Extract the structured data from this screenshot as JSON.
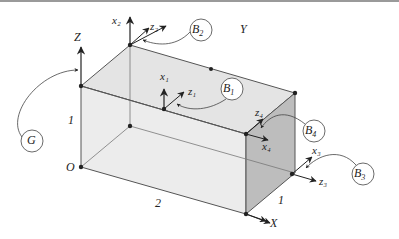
{
  "diagram": {
    "type": "3D box with coordinate frames",
    "global_axes": {
      "x_label": "X",
      "y_label": "Y",
      "z_label": "Z",
      "origin_label": "O"
    },
    "dimensions": {
      "length": "2",
      "width": "1",
      "height": "1"
    },
    "frames": [
      {
        "id": "B1",
        "x_label": "x1",
        "z_label": "z1",
        "body_label": "B1"
      },
      {
        "id": "B2",
        "x_label": "x2",
        "z_label": "z2",
        "body_label": "B2"
      },
      {
        "id": "B3",
        "x_label": "x3",
        "z_label": "z3",
        "body_label": "B3"
      },
      {
        "id": "B4",
        "x_label": "x4",
        "z_label": "z4",
        "body_label": "B4"
      }
    ],
    "ground_label": "G",
    "colors": {
      "top_face": "#e6e6e6",
      "front_face": "#e9e9e9",
      "side_face": "#b9b9b9",
      "line": "#444444"
    }
  }
}
